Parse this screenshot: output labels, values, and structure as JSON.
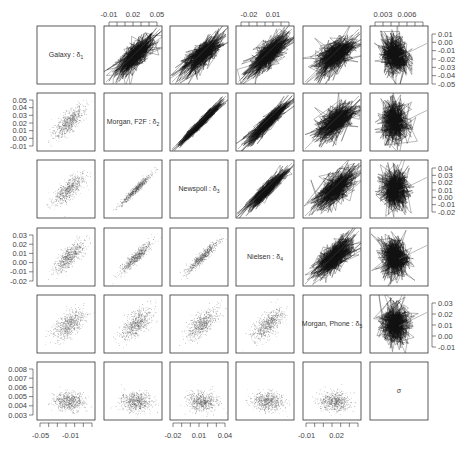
{
  "chart_data": {
    "type": "scatter",
    "subtype": "pairs_matrix",
    "title": "",
    "variables": [
      {
        "name": "Galaxy : δ1",
        "label": "Galaxy : ",
        "sub": "δ",
        "index": "1",
        "range": [
          -0.05,
          0.015
        ]
      },
      {
        "name": "Morgan, F2F : δ2",
        "label": "Morgan, F2F : ",
        "sub": "δ",
        "index": "2",
        "range": [
          -0.015,
          0.055
        ]
      },
      {
        "name": "Newspoll : δ3",
        "label": "Newspoll : ",
        "sub": "δ",
        "index": "3",
        "range": [
          -0.025,
          0.045
        ]
      },
      {
        "name": "Nielsen : δ4",
        "label": "Nielsen : ",
        "sub": "δ",
        "index": "4",
        "range": [
          -0.025,
          0.035
        ]
      },
      {
        "name": "Morgan, Phone : δ5",
        "label": "Morgan, Phone : ",
        "sub": "δ",
        "index": "5",
        "range": [
          -0.015,
          0.035
        ]
      },
      {
        "name": "σ",
        "label": "σ",
        "sub": "",
        "index": "",
        "range": [
          0.0028,
          0.0082
        ]
      }
    ],
    "top_axis": [
      {
        "column": 2,
        "ticks": [
          "-0.01",
          "0.02",
          "0.05"
        ]
      },
      {
        "column": 4,
        "ticks": [
          "-0.02",
          "0.01"
        ]
      },
      {
        "column": 6,
        "ticks": [
          "0.003",
          "0.006"
        ]
      }
    ],
    "bottom_axis": [
      {
        "column": 1,
        "ticks": [
          "-0.05",
          "-0.01"
        ]
      },
      {
        "column": 3,
        "ticks": [
          "-0.02",
          "0.01",
          "0.04"
        ]
      },
      {
        "column": 5,
        "ticks": [
          "-0.01",
          "0.02"
        ]
      }
    ],
    "left_axis": [
      {
        "row": 2,
        "ticks": [
          "0.05",
          "0.04",
          "0.03",
          "0.02",
          "0.01",
          "0.00",
          "-0.01"
        ]
      },
      {
        "row": 4,
        "ticks": [
          "0.03",
          "0.02",
          "0.01",
          "0.00",
          "-0.01",
          "-0.02"
        ]
      },
      {
        "row": 6,
        "ticks": [
          "0.008",
          "0.007",
          "0.006",
          "0.005",
          "0.004",
          "0.003"
        ]
      }
    ],
    "right_axis": [
      {
        "row": 1,
        "ticks": [
          "0.01",
          "0.00",
          "-0.01",
          "-0.02",
          "-0.03",
          "-0.04",
          "-0.05"
        ]
      },
      {
        "row": 3,
        "ticks": [
          "0.04",
          "0.03",
          "0.02",
          "0.01",
          "0.00",
          "-0.01",
          "-0.02"
        ]
      },
      {
        "row": 5,
        "ticks": [
          "0.03",
          "0.02",
          "0.01",
          "0.00",
          "-0.01"
        ]
      }
    ],
    "pair_correlations": {
      "1-2": 0.75,
      "1-3": 0.75,
      "1-4": 0.75,
      "1-5": 0.6,
      "1-6": -0.1,
      "2-3": 0.97,
      "2-4": 0.92,
      "2-5": 0.65,
      "2-6": -0.05,
      "3-4": 0.93,
      "3-5": 0.65,
      "3-6": -0.05,
      "4-5": 0.65,
      "4-6": -0.05,
      "5-6": -0.05
    },
    "grid": false,
    "legend": "none",
    "colors": {
      "points": "#555555",
      "lines": "#111111",
      "frame": "#333333"
    }
  }
}
